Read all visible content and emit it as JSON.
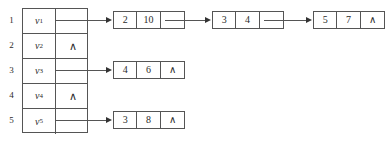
{
  "diagram": {
    "nil_symbol": "∧",
    "vertex_table": {
      "rows": [
        {
          "index": "1",
          "vertex": "v",
          "subscript": "1",
          "pointer": "link",
          "nil": ""
        },
        {
          "index": "2",
          "vertex": "v",
          "subscript": "2",
          "pointer": "nil",
          "nil": "∧"
        },
        {
          "index": "3",
          "vertex": "v",
          "subscript": "3",
          "pointer": "link",
          "nil": ""
        },
        {
          "index": "4",
          "vertex": "v",
          "subscript": "4",
          "pointer": "nil",
          "nil": "∧"
        },
        {
          "index": "5",
          "vertex": "v",
          "subscript": "5",
          "pointer": "link",
          "nil": ""
        }
      ]
    },
    "lists": [
      {
        "row": "1",
        "nodes": [
          {
            "vertex": "2",
            "weight": "10",
            "link": ""
          },
          {
            "vertex": "3",
            "weight": "4",
            "link": ""
          },
          {
            "vertex": "5",
            "weight": "7",
            "link": "∧"
          }
        ]
      },
      {
        "row": "3",
        "nodes": [
          {
            "vertex": "4",
            "weight": "6",
            "link": "∧"
          }
        ]
      },
      {
        "row": "5",
        "nodes": [
          {
            "vertex": "3",
            "weight": "8",
            "link": "∧"
          }
        ]
      }
    ],
    "colors": {
      "line": "#555555",
      "text": "#2b2b2b",
      "background": "#ffffff"
    }
  }
}
